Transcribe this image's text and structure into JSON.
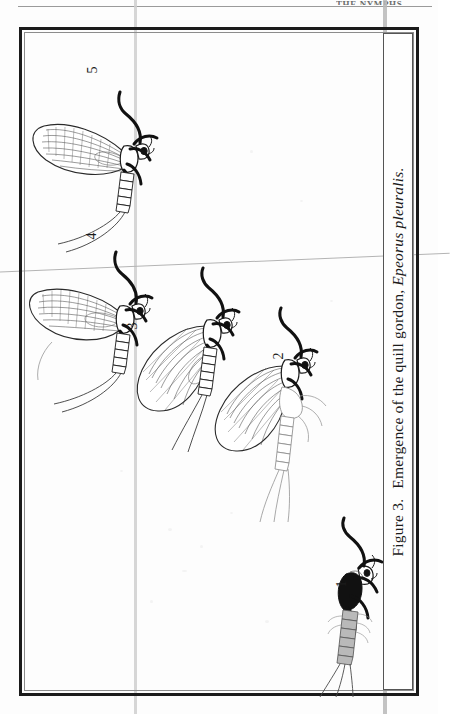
{
  "page": {
    "header_remnant": "THE NYMPHS",
    "background_color": "#fdfdfd",
    "ink_color": "#1b1b1b"
  },
  "figure": {
    "caption_label": "Figure 3.",
    "caption_text": "Emergence of the quill gordon,",
    "caption_species": "Epeorus pleuralis.",
    "caption_full": "Figure 3.  Emergence of the quill gordon, Epeorus pleuralis.",
    "frame_color": "#1b1b1b",
    "stages": [
      {
        "number": "1",
        "name": "mature-nymph",
        "description": "Mature nymph with darkened black wing pads, gray segmented abdomen and three tails"
      },
      {
        "number": "2",
        "name": "dun-emerging-from-shuck",
        "description": "Dun emerging, pulling free of the split nymphal shuck"
      },
      {
        "number": "3",
        "name": "dun-newly-emerged",
        "description": "Newly emerged dun with folded veined wings and two tails"
      },
      {
        "number": "4",
        "name": "dun-wings-drying",
        "description": "Dun with wings spread and drying"
      },
      {
        "number": "5",
        "name": "spinner-fully-winged",
        "description": "Fully winged spinner ready for flight"
      }
    ]
  }
}
